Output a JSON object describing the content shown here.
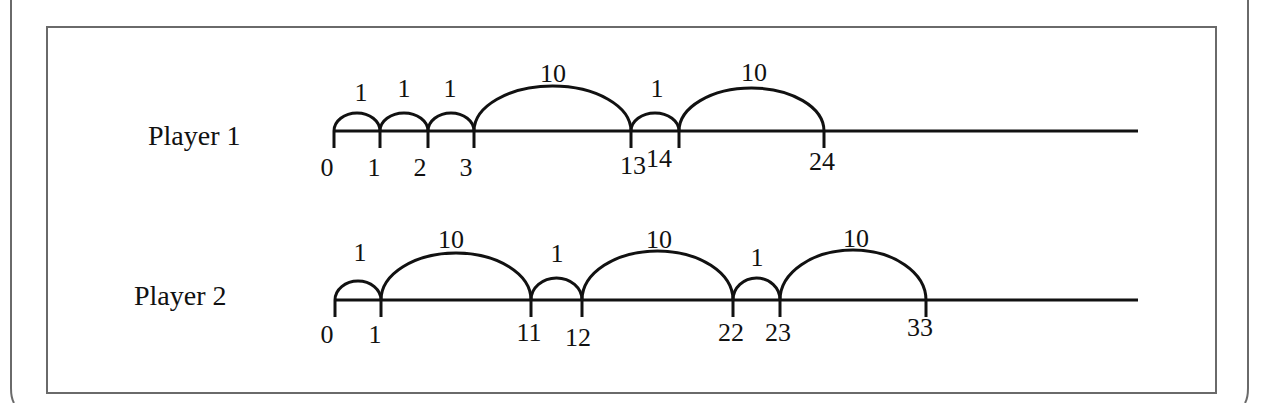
{
  "figure": {
    "rows": [
      {
        "label": "Player 1",
        "line_y": 131,
        "line_x_start": 334,
        "line_x_end": 1138,
        "ticks": [
          {
            "value": "0",
            "x": 334,
            "label_x": 327,
            "label_y": 176
          },
          {
            "value": "1",
            "x": 380,
            "label_x": 374,
            "label_y": 176
          },
          {
            "value": "2",
            "x": 428,
            "label_x": 420,
            "label_y": 176
          },
          {
            "value": "3",
            "x": 474,
            "label_x": 466,
            "label_y": 176
          },
          {
            "value": "13",
            "x": 631,
            "label_x": 633,
            "label_y": 174
          },
          {
            "value": "14",
            "x": 679,
            "label_x": 659,
            "label_y": 167
          },
          {
            "value": "24",
            "x": 824,
            "label_x": 822,
            "label_y": 170
          }
        ],
        "jumps": [
          {
            "size": "1",
            "from": 334,
            "to": 380,
            "peak_y": 113,
            "label_x": 361,
            "label_y": 101
          },
          {
            "size": "1",
            "from": 380,
            "to": 428,
            "peak_y": 113,
            "label_x": 404,
            "label_y": 97
          },
          {
            "size": "1",
            "from": 428,
            "to": 474,
            "peak_y": 113,
            "label_x": 450,
            "label_y": 97
          },
          {
            "size": "10",
            "from": 474,
            "to": 631,
            "peak_y": 86,
            "label_x": 553,
            "label_y": 82
          },
          {
            "size": "1",
            "from": 631,
            "to": 679,
            "peak_y": 113,
            "label_x": 657,
            "label_y": 97
          },
          {
            "size": "10",
            "from": 679,
            "to": 824,
            "peak_y": 88,
            "label_x": 754,
            "label_y": 81
          }
        ]
      },
      {
        "label": "Player 2",
        "line_y": 300,
        "line_x_start": 335,
        "line_x_end": 1138,
        "ticks": [
          {
            "value": "0",
            "x": 335,
            "label_x": 327,
            "label_y": 343
          },
          {
            "value": "1",
            "x": 381,
            "label_x": 375,
            "label_y": 343
          },
          {
            "value": "11",
            "x": 531,
            "label_x": 529,
            "label_y": 341
          },
          {
            "value": "12",
            "x": 582,
            "label_x": 578,
            "label_y": 346
          },
          {
            "value": "22",
            "x": 733,
            "label_x": 731,
            "label_y": 341
          },
          {
            "value": "23",
            "x": 780,
            "label_x": 778,
            "label_y": 341
          },
          {
            "value": "33",
            "x": 926,
            "label_x": 920,
            "label_y": 336
          }
        ],
        "jumps": [
          {
            "size": "1",
            "from": 335,
            "to": 381,
            "peak_y": 281,
            "label_x": 360,
            "label_y": 261
          },
          {
            "size": "10",
            "from": 381,
            "to": 531,
            "peak_y": 253,
            "label_x": 451,
            "label_y": 248
          },
          {
            "size": "1",
            "from": 531,
            "to": 582,
            "peak_y": 278,
            "label_x": 557,
            "label_y": 262
          },
          {
            "size": "10",
            "from": 582,
            "to": 733,
            "peak_y": 251,
            "label_x": 659,
            "label_y": 248
          },
          {
            "size": "1",
            "from": 733,
            "to": 780,
            "peak_y": 278,
            "label_x": 757,
            "label_y": 266
          },
          {
            "size": "10",
            "from": 780,
            "to": 926,
            "peak_y": 250,
            "label_x": 856,
            "label_y": 247
          }
        ]
      }
    ],
    "colors": {
      "stroke": "#111111",
      "frame": "#6a6a6a",
      "background": "#ffffff"
    }
  }
}
